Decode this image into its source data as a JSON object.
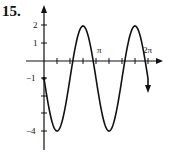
{
  "problem_number": "15.",
  "chart_data": {
    "type": "line",
    "title": "",
    "function": "y = -1 - 3 sin(2x)",
    "xlabel": "",
    "ylabel": "",
    "x_tick_labels": [
      "π",
      "2π"
    ],
    "y_tick_labels": [
      "2",
      "1",
      "−1",
      "−4"
    ],
    "xlim": [
      0,
      6.283
    ],
    "ylim": [
      -4,
      2
    ],
    "x": [
      0,
      0.785,
      1.571,
      2.356,
      3.142,
      3.927,
      4.712,
      5.498,
      6.283
    ],
    "values": [
      -1,
      -4,
      -1,
      2,
      -1,
      -4,
      -1,
      2,
      -1
    ],
    "grid": false,
    "legend": "none"
  },
  "axis": {
    "pi_label": "π",
    "two_pi_label": "2π",
    "y2": "2",
    "y1": "1",
    "ym1": "−1",
    "ym4": "−4"
  }
}
